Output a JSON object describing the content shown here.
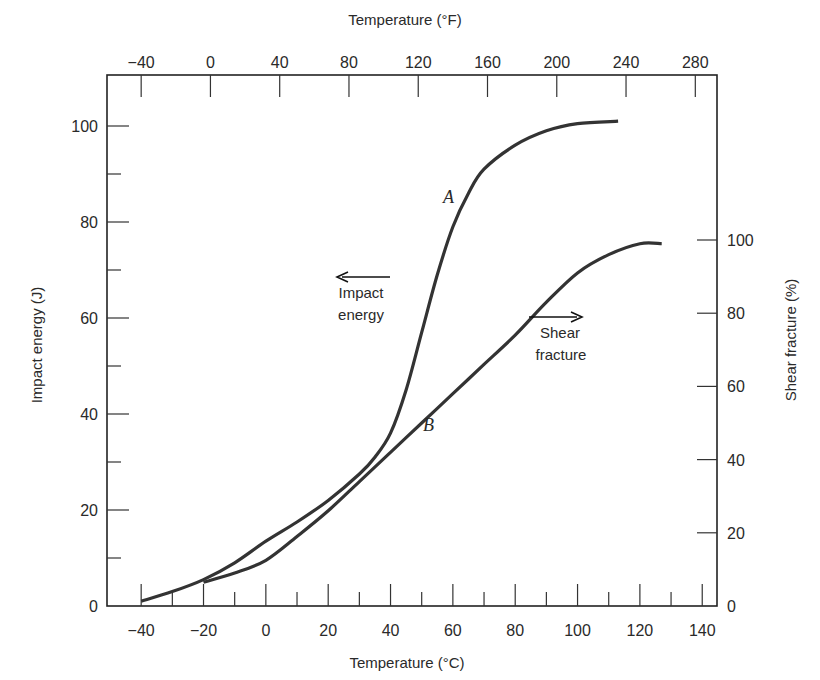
{
  "chart_data": {
    "type": "line",
    "title": "",
    "xlabel": "Temperature (°C)",
    "x2label": "Temperature (°F)",
    "ylabel": "Impact energy (J)",
    "y2label": "Shear fracture (%)",
    "xlim": [
      -50,
      150
    ],
    "ylim": [
      0,
      110
    ],
    "y2lim": [
      0,
      100
    ],
    "grid": false,
    "legend": "none",
    "x_ticks": [
      -40,
      -20,
      0,
      20,
      40,
      60,
      80,
      100,
      120,
      140
    ],
    "x_ticks_labels": [
      "−40",
      "−20",
      "0",
      "20",
      "40",
      "60",
      "80",
      "100",
      "120",
      "140"
    ],
    "x2_ticks": [
      -40,
      0,
      40,
      80,
      120,
      160,
      200,
      240,
      280
    ],
    "x2_ticks_labels": [
      "−40",
      "0",
      "40",
      "80",
      "120",
      "160",
      "200",
      "240",
      "280"
    ],
    "y_ticks": [
      0,
      20,
      40,
      60,
      80,
      100
    ],
    "y2_ticks": [
      0,
      20,
      40,
      60,
      80,
      100
    ],
    "series": [
      {
        "name": "A",
        "description": "Impact energy (left axis, J)",
        "axis": "left",
        "x": [
          -40,
          -30,
          -20,
          -10,
          0,
          10,
          20,
          30,
          35,
          40,
          45,
          50,
          55,
          60,
          65,
          70,
          80,
          90,
          100,
          113
        ],
        "values": [
          1,
          3,
          5.5,
          9,
          13.5,
          17.5,
          22,
          27.5,
          31,
          36,
          45,
          57,
          69,
          79,
          86,
          91,
          96,
          99,
          100.5,
          101
        ]
      },
      {
        "name": "B",
        "description": "Shear fracture (right axis, %)",
        "axis": "right",
        "x": [
          -20,
          -10,
          0,
          10,
          20,
          30,
          40,
          50,
          60,
          70,
          80,
          90,
          100,
          110,
          120,
          127
        ],
        "values": [
          6.5,
          9,
          12.5,
          19,
          26,
          34,
          42,
          50,
          58,
          66,
          74,
          83,
          91,
          96,
          99,
          99
        ]
      }
    ],
    "annotations": [
      {
        "text": "A",
        "near_series": "A",
        "x": 60,
        "y": 85
      },
      {
        "text": "B",
        "near_series": "B",
        "x": 53,
        "y": 38
      },
      {
        "text": "Impact energy",
        "arrow": "left",
        "meaning": "curve A read on left axis"
      },
      {
        "text": "Shear fracture",
        "arrow": "right",
        "meaning": "curve B read on right axis"
      }
    ]
  },
  "labels": {
    "top_axis_title": "Temperature (°F)",
    "bottom_axis_title": "Temperature (°C)",
    "left_axis_title": "Impact energy (J)",
    "right_axis_title": "Shear fracture (%)",
    "curve_a": "A",
    "curve_b": "B",
    "impact_line1": "Impact",
    "impact_line2": "energy",
    "shear_line1": "Shear",
    "shear_line2": "fracture"
  }
}
